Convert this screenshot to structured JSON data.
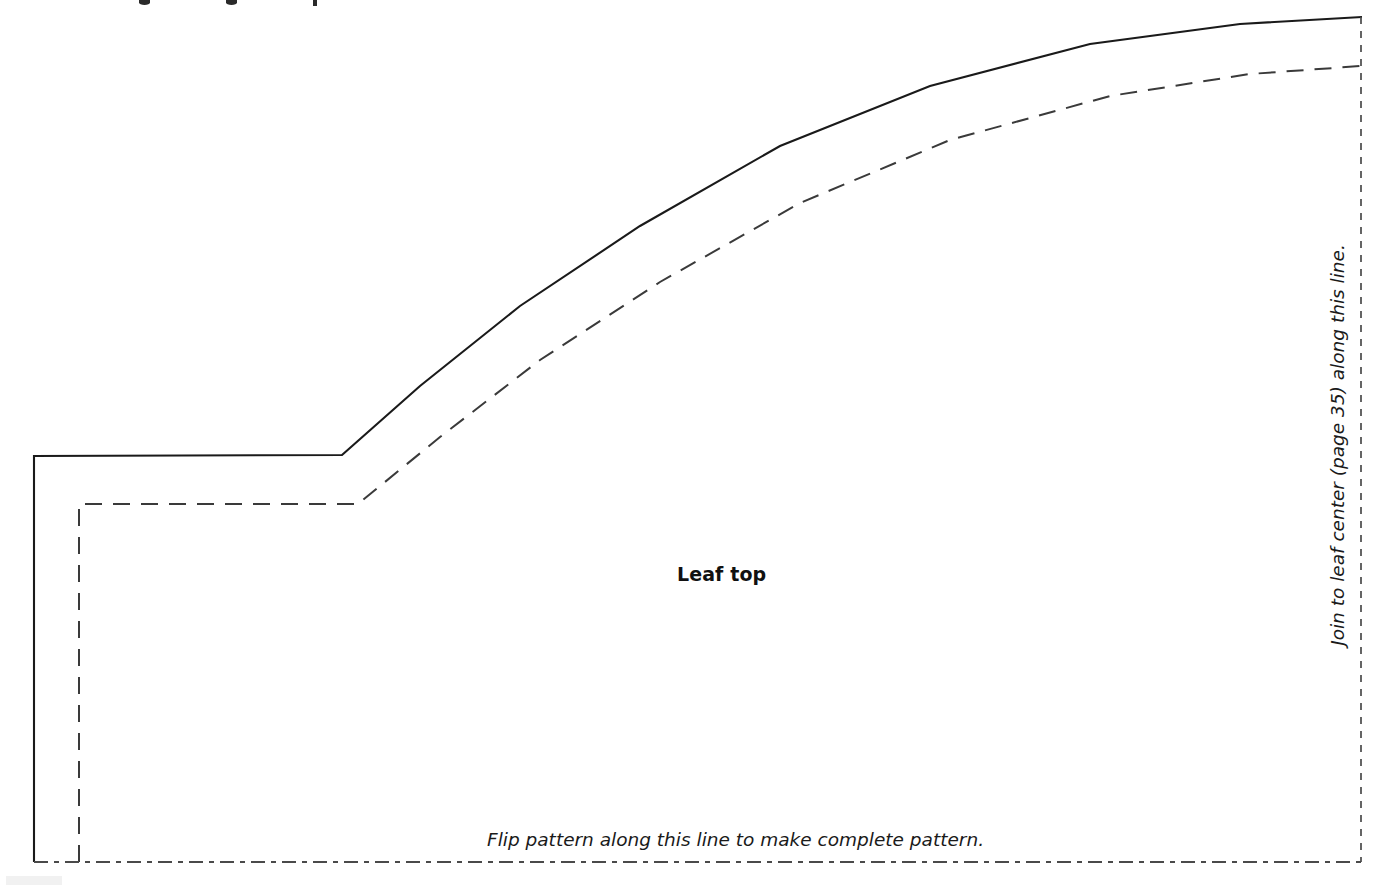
{
  "document": {
    "type": "sewing-pattern-template",
    "background_color": "#ffffff",
    "ink_color": "#1a1a1a"
  },
  "labels": {
    "piece_name": "Leaf top",
    "fold_instruction": "Flip pattern along this line to make complete pattern.",
    "join_instruction": "Join to leaf center (page 35) along this line."
  },
  "lines": {
    "cutting_line": {
      "name": "cutting-line",
      "style": "solid",
      "color": "#1a1a1a",
      "path": "M 34 862 L 34 456 L 342 455 L 420 386 L 520 306 L 640 226 L 780 146 L 930 86 L 1090 44 L 1240 24 L 1362 17"
    },
    "seam_line": {
      "name": "seam-allowance-line",
      "style": "dashed",
      "color": "#3a3a3a",
      "dash": "17 11",
      "path": "M 79 862 L 79 504 L 358 504 L 440 437 L 540 360 L 660 282 L 800 203 L 950 140 L 1110 96 L 1250 74 L 1361 66"
    },
    "join_line": {
      "name": "join-edge-line",
      "style": "fine-dashed",
      "color": "#4a4a4a",
      "dash": "7 7",
      "orientation": "vertical",
      "x": 1361,
      "y_start": 17,
      "y_end": 862
    },
    "fold_line": {
      "name": "fold-line",
      "style": "dash-dot",
      "color": "#4a4a4a",
      "dash": "14 6 5 6",
      "orientation": "horizontal",
      "y": 862,
      "x_start": 34,
      "x_end": 1361
    }
  }
}
